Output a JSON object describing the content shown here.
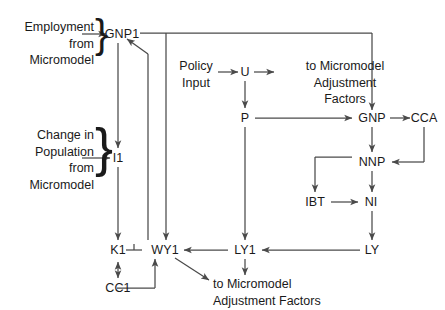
{
  "diagram": {
    "stroke_color": "#4a4a4a",
    "text_color": "#1a1a1a",
    "background_color": "#ffffff",
    "inputs": [
      {
        "id": "employment-input",
        "lines": [
          "Employment",
          "from",
          "Micromodel"
        ],
        "brace": "}"
      },
      {
        "id": "population-input",
        "lines": [
          "Change in",
          "Population",
          "from",
          "Micromodel"
        ],
        "brace": "}"
      },
      {
        "id": "policy-input",
        "lines": [
          "Policy",
          "Input"
        ]
      }
    ],
    "nodes": [
      {
        "id": "gnp1",
        "label": "GNP1"
      },
      {
        "id": "i1",
        "label": "I1"
      },
      {
        "id": "k1",
        "label": "K1"
      },
      {
        "id": "cc1",
        "label": "CC1"
      },
      {
        "id": "wy1",
        "label": "WY1"
      },
      {
        "id": "u",
        "label": "U"
      },
      {
        "id": "p",
        "label": "P"
      },
      {
        "id": "gnp",
        "label": "GNP"
      },
      {
        "id": "cca",
        "label": "CCA"
      },
      {
        "id": "nnp",
        "label": "NNP"
      },
      {
        "id": "ibt",
        "label": "IBT"
      },
      {
        "id": "ni",
        "label": "NI"
      },
      {
        "id": "ly",
        "label": "LY"
      },
      {
        "id": "ly1",
        "label": "LY1"
      }
    ],
    "outputs": [
      {
        "id": "output-top",
        "lines": [
          "to Micromodel",
          "Adjustment",
          "Factors"
        ]
      },
      {
        "id": "output-bottom",
        "lines": [
          "to Micromodel",
          "Adjustment Factors"
        ]
      }
    ],
    "edges": [
      {
        "from": "employment-input",
        "to": "gnp1"
      },
      {
        "from": "population-input",
        "to": "i1"
      },
      {
        "from": "gnp1",
        "to": "i1"
      },
      {
        "from": "i1",
        "to": "k1"
      },
      {
        "from": "gnp1",
        "to": "gnp"
      },
      {
        "from": "wy1",
        "to": "gnp1"
      },
      {
        "from": "k1",
        "to": "cc1",
        "type": "double"
      },
      {
        "from": "cc1",
        "to": "wy1"
      },
      {
        "from": "k1",
        "to": "wy1"
      },
      {
        "from": "policy-input",
        "to": "u"
      },
      {
        "from": "u",
        "to": "output-top"
      },
      {
        "from": "u",
        "to": "p"
      },
      {
        "from": "p",
        "to": "gnp"
      },
      {
        "from": "p",
        "to": "ly1"
      },
      {
        "from": "gnp",
        "to": "cca"
      },
      {
        "from": "gnp",
        "to": "nnp"
      },
      {
        "from": "cca",
        "to": "nnp"
      },
      {
        "from": "nnp",
        "to": "ibt"
      },
      {
        "from": "nnp",
        "to": "ni"
      },
      {
        "from": "ibt",
        "to": "ni"
      },
      {
        "from": "ni",
        "to": "ly"
      },
      {
        "from": "ly",
        "to": "ly1"
      },
      {
        "from": "ly1",
        "to": "wy1"
      },
      {
        "from": "ly1",
        "to": "output-bottom"
      },
      {
        "from": "wy1",
        "to": "output-bottom"
      },
      {
        "from": "top-bus",
        "to": "wy1"
      }
    ]
  }
}
